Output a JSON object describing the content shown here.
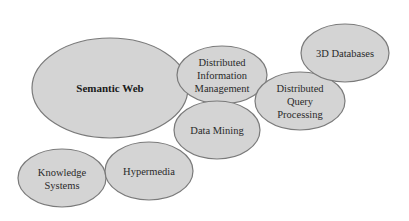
{
  "diagram": {
    "type": "overlapping-ellipses",
    "fill_color": "#d4d4d4",
    "stroke_color": "#7a7a7a",
    "nodes": [
      {
        "id": "semantic-web",
        "lines": [
          "Semantic Web"
        ],
        "bold": true,
        "cx": 110,
        "cy": 88,
        "rx": 78,
        "ry": 50
      },
      {
        "id": "distributed-information-management",
        "lines": [
          "Distributed",
          "Information",
          "Management"
        ],
        "bold": false,
        "cx": 222,
        "cy": 75,
        "rx": 45,
        "ry": 29
      },
      {
        "id": "data-mining",
        "lines": [
          "Data Mining"
        ],
        "bold": false,
        "cx": 217,
        "cy": 130,
        "rx": 43,
        "ry": 29
      },
      {
        "id": "distributed-query-processing",
        "lines": [
          "Distributed",
          "Query",
          "Processing"
        ],
        "bold": false,
        "cx": 300,
        "cy": 101,
        "rx": 45,
        "ry": 29
      },
      {
        "id": "3d-databases",
        "lines": [
          "3D Databases"
        ],
        "bold": false,
        "cx": 345,
        "cy": 53,
        "rx": 44,
        "ry": 29
      },
      {
        "id": "knowledge-systems",
        "lines": [
          "Knowledge",
          "Systems"
        ],
        "bold": false,
        "cx": 62,
        "cy": 178,
        "rx": 44,
        "ry": 29
      },
      {
        "id": "hypermedia",
        "lines": [
          "Hypermedia"
        ],
        "bold": false,
        "cx": 149,
        "cy": 171,
        "rx": 44,
        "ry": 29
      }
    ]
  }
}
